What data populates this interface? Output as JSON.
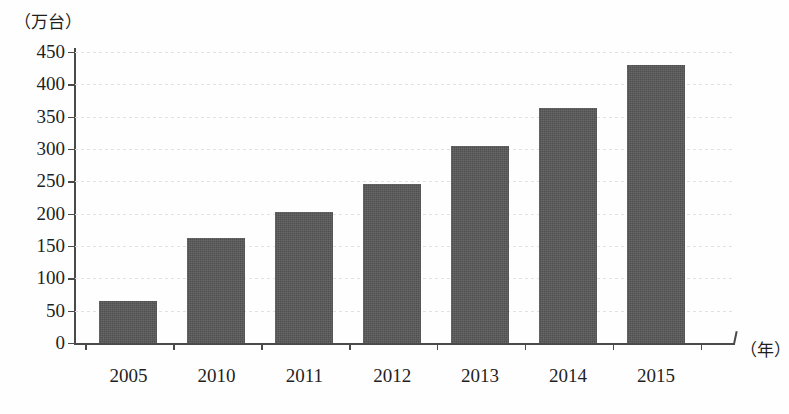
{
  "chart_data": {
    "type": "bar",
    "title": "",
    "xlabel": "（年）",
    "ylabel": "（万台）",
    "categories": [
      "2005",
      "2010",
      "2011",
      "2012",
      "2013",
      "2014",
      "2015"
    ],
    "values": [
      65,
      162,
      202,
      246,
      305,
      363,
      430
    ],
    "ylim": [
      0,
      450
    ],
    "ytick_values": [
      0,
      50,
      100,
      150,
      200,
      250,
      300,
      350,
      400,
      450
    ],
    "ytick_labels": [
      "0",
      "50",
      "100",
      "150",
      "200",
      "250",
      "300",
      "350",
      "400",
      "450"
    ],
    "grid": true,
    "legend": false,
    "series": [
      {
        "name": "",
        "values": [
          65,
          162,
          202,
          246,
          305,
          363,
          430
        ]
      }
    ],
    "bar_color": "#585858",
    "axis_color": "#4a4a4a",
    "grid_color": "#e2e2e2",
    "background_color": "#fefefe"
  }
}
